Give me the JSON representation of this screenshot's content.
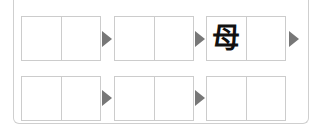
{
  "colors": {
    "border": "#cccccc",
    "arrow": "#777777",
    "text": "#111111"
  },
  "rows": [
    {
      "groups": [
        {
          "cells": [
            "",
            ""
          ]
        },
        {
          "cells": [
            "",
            ""
          ]
        },
        {
          "cells": [
            "母",
            ""
          ]
        }
      ],
      "arrows": [
        "play-arrow-icon",
        "play-arrow-icon",
        "play-arrow-icon"
      ]
    },
    {
      "groups": [
        {
          "cells": [
            "",
            ""
          ]
        },
        {
          "cells": [
            "",
            ""
          ]
        },
        {
          "cells": [
            "",
            ""
          ]
        }
      ],
      "arrows": [
        "play-arrow-icon",
        "play-arrow-icon"
      ]
    }
  ]
}
